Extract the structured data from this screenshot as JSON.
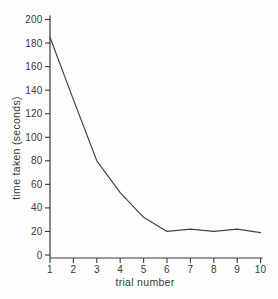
{
  "figure": {
    "background_color": "#fdfdfc",
    "axis_color": "#3a3a3a",
    "line_color": "#444444",
    "text_color": "#3a3a3a"
  },
  "chart_data": {
    "type": "line",
    "title": "",
    "xlabel": "trial number",
    "ylabel": "time taken (seconds)",
    "x": [
      1,
      2,
      3,
      4,
      5,
      6,
      7,
      8,
      9,
      10
    ],
    "values": [
      185,
      132,
      80,
      53,
      32,
      20,
      22,
      20,
      22,
      19
    ],
    "xlim": [
      1,
      10
    ],
    "ylim": [
      0,
      200
    ],
    "x_ticks": [
      1,
      2,
      3,
      4,
      5,
      6,
      7,
      8,
      9,
      10
    ],
    "y_ticks": [
      0,
      20,
      40,
      60,
      80,
      100,
      120,
      140,
      160,
      180,
      200
    ],
    "grid": false,
    "legend_position": "none"
  }
}
